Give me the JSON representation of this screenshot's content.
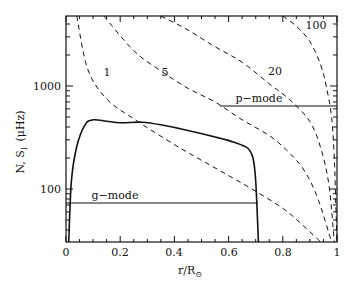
{
  "chart_data": {
    "type": "line",
    "title": "",
    "xlabel": "r/R☉",
    "ylabel": "N, S_l (μHz)",
    "xlim": [
      0,
      1
    ],
    "ylim": [
      30,
      4800
    ],
    "yscale": "log",
    "x_ticks": [
      {
        "value": 0,
        "label": "0"
      },
      {
        "value": 0.2,
        "label": "0.2"
      },
      {
        "value": 0.4,
        "label": "0.4"
      },
      {
        "value": 0.6,
        "label": "0.6"
      },
      {
        "value": 0.8,
        "label": "0.8"
      },
      {
        "value": 1,
        "label": "1"
      }
    ],
    "y_ticks": [
      {
        "value": 100,
        "label": "100"
      },
      {
        "value": 1000,
        "label": "1000"
      }
    ],
    "series": [
      {
        "name": "N (buoyancy frequency)",
        "style": "solid",
        "points": [
          [
            0.01,
            30
          ],
          [
            0.02,
            120
          ],
          [
            0.04,
            260
          ],
          [
            0.07,
            420
          ],
          [
            0.1,
            470
          ],
          [
            0.15,
            455
          ],
          [
            0.2,
            440
          ],
          [
            0.28,
            445
          ],
          [
            0.35,
            420
          ],
          [
            0.45,
            370
          ],
          [
            0.55,
            320
          ],
          [
            0.62,
            285
          ],
          [
            0.67,
            250
          ],
          [
            0.69,
            200
          ],
          [
            0.7,
            120
          ],
          [
            0.71,
            30
          ]
        ]
      },
      {
        "name": "S_l, l=1",
        "label": "1",
        "style": "dashed",
        "points": [
          [
            0.04,
            4800
          ],
          [
            0.08,
            1460
          ],
          [
            0.15,
            750
          ],
          [
            0.25,
            480
          ],
          [
            0.4,
            270
          ],
          [
            0.5,
            190
          ],
          [
            0.6,
            135
          ],
          [
            0.7,
            95
          ],
          [
            0.8,
            65
          ],
          [
            0.86,
            48
          ],
          [
            0.94,
            30
          ]
        ]
      },
      {
        "name": "S_l, l=5",
        "label": "5",
        "style": "dashed",
        "points": [
          [
            0.14,
            4800
          ],
          [
            0.25,
            2200
          ],
          [
            0.35,
            1400
          ],
          [
            0.45,
            950
          ],
          [
            0.55,
            700
          ],
          [
            0.65,
            470
          ],
          [
            0.75,
            330
          ],
          [
            0.82,
            230
          ],
          [
            0.88,
            150
          ],
          [
            0.93,
            80
          ],
          [
            0.98,
            30
          ]
        ]
      },
      {
        "name": "S_l, l=20",
        "label": "20",
        "style": "dashed",
        "points": [
          [
            0.35,
            4800
          ],
          [
            0.45,
            3500
          ],
          [
            0.55,
            2400
          ],
          [
            0.65,
            1700
          ],
          [
            0.75,
            1050
          ],
          [
            0.83,
            720
          ],
          [
            0.9,
            450
          ],
          [
            0.94,
            250
          ],
          [
            0.97,
            110
          ],
          [
            0.99,
            30
          ]
        ]
      },
      {
        "name": "S_l, l=100",
        "label": "100",
        "style": "dashed",
        "points": [
          [
            0.8,
            4800
          ],
          [
            0.85,
            3800
          ],
          [
            0.9,
            2700
          ],
          [
            0.94,
            1600
          ],
          [
            0.96,
            1000
          ],
          [
            0.98,
            500
          ],
          [
            0.99,
            200
          ],
          [
            0.995,
            80
          ],
          [
            1.0,
            30
          ]
        ]
      }
    ],
    "annotations": [
      {
        "text": "g-mode",
        "type": "horizontal-line",
        "y": 73,
        "x_range": [
          0,
          0.71
        ]
      },
      {
        "text": "p-mode",
        "type": "horizontal-line",
        "y": 640,
        "x_range": [
          0.57,
          1.0
        ]
      }
    ],
    "grid": false,
    "legend": "none (curves labeled inline)"
  },
  "labels": {
    "curve_1": "1",
    "curve_5": "5",
    "curve_20": "20",
    "curve_100": "100",
    "g_mode": "g−mode",
    "p_mode": "p−mode",
    "x_axis_title": "r/R",
    "x_axis_sub": "⊙",
    "y_axis_title": "N, S",
    "y_axis_sub": "l",
    "y_axis_unit": "(μHz)"
  },
  "ticks": {
    "x": [
      "0",
      "0.2",
      "0.4",
      "0.6",
      "0.8",
      "1"
    ],
    "y": [
      "100",
      "1000"
    ]
  }
}
